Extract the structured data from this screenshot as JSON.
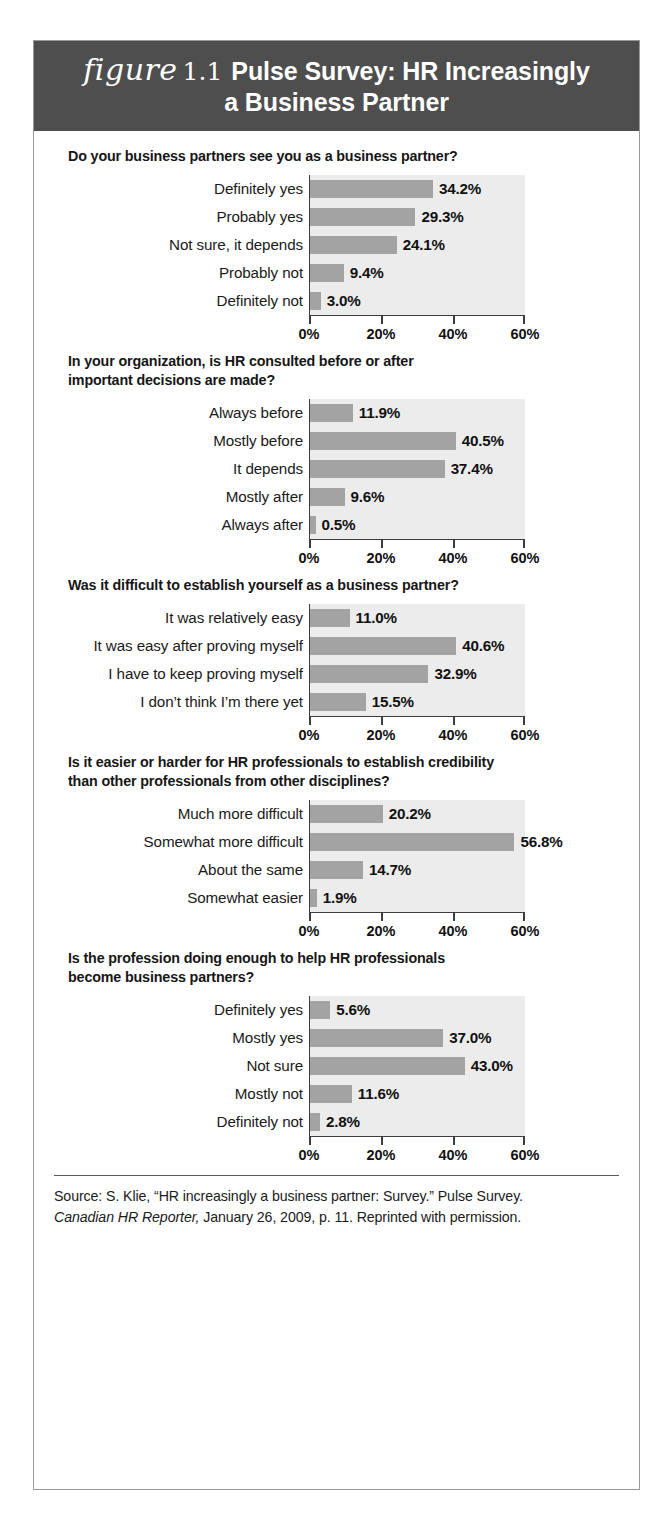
{
  "figure": {
    "label_word": "figure",
    "number": "1.1",
    "title_line1": "Pulse Survey: HR Increasingly",
    "title_line2": "a Business Partner",
    "header_bg": "#4e4e4e",
    "bar_color": "#a3a3a3",
    "plot_bg": "#ececec",
    "axis_color": "#3d3d3d"
  },
  "source": {
    "line1": "Source: S. Klie, “HR increasingly a business partner: Survey.” Pulse Survey.",
    "line2_italic": "Canadian HR Reporter,",
    "line2_rest": " January 26, 2009, p. 11. Reprinted with permission."
  },
  "axis": {
    "ticks": [
      "0%",
      "20%",
      "40%",
      "60%"
    ],
    "min": 0,
    "max": 60
  },
  "chart_data": [
    {
      "type": "bar",
      "orientation": "horizontal",
      "title": "Do your business partners see you as a business partner?",
      "categories": [
        "Definitely yes",
        "Probably yes",
        "Not sure, it depends",
        "Probably not",
        "Definitely not"
      ],
      "values": [
        34.2,
        29.3,
        24.1,
        9.4,
        3.0
      ],
      "labels": [
        "34.2%",
        "29.3%",
        "24.1%",
        "9.4%",
        "3.0%"
      ],
      "xlabel": "",
      "ylabel": "",
      "xlim": [
        0,
        60
      ],
      "xticks": [
        "0%",
        "20%",
        "40%",
        "60%"
      ],
      "grid": false,
      "legend": false
    },
    {
      "type": "bar",
      "orientation": "horizontal",
      "title": "In your organization, is HR consulted before or after important decisions are made?",
      "title_line1": "In your organization, is HR consulted before or after",
      "title_line2": "important decisions are made?",
      "categories": [
        "Always before",
        "Mostly before",
        "It depends",
        "Mostly after",
        "Always after"
      ],
      "values": [
        11.9,
        40.5,
        37.4,
        9.6,
        0.5
      ],
      "labels": [
        "11.9%",
        "40.5%",
        "37.4%",
        "9.6%",
        "0.5%"
      ],
      "xlabel": "",
      "ylabel": "",
      "xlim": [
        0,
        60
      ],
      "xticks": [
        "0%",
        "20%",
        "40%",
        "60%"
      ],
      "grid": false,
      "legend": false
    },
    {
      "type": "bar",
      "orientation": "horizontal",
      "title": "Was it difficult to establish yourself as a business partner?",
      "categories": [
        "It was relatively easy",
        "It was easy after proving myself",
        "I have to keep proving myself",
        "I don’t think I’m there yet"
      ],
      "values": [
        11.0,
        40.6,
        32.9,
        15.5
      ],
      "labels": [
        "11.0%",
        "40.6%",
        "32.9%",
        "15.5%"
      ],
      "xlabel": "",
      "ylabel": "",
      "xlim": [
        0,
        60
      ],
      "xticks": [
        "0%",
        "20%",
        "40%",
        "60%"
      ],
      "grid": false,
      "legend": false
    },
    {
      "type": "bar",
      "orientation": "horizontal",
      "title": "Is it easier or harder for HR professionals to establish credibility than other professionals from other disciplines?",
      "title_line1": "Is it easier or harder for HR professionals to establish credibility",
      "title_line2": "than other professionals from other disciplines?",
      "categories": [
        "Much more difficult",
        "Somewhat more difficult",
        "About the same",
        "Somewhat easier"
      ],
      "values": [
        20.2,
        56.8,
        14.7,
        1.9
      ],
      "labels": [
        "20.2%",
        "56.8%",
        "14.7%",
        "1.9%"
      ],
      "xlabel": "",
      "ylabel": "",
      "xlim": [
        0,
        60
      ],
      "xticks": [
        "0%",
        "20%",
        "40%",
        "60%"
      ],
      "grid": false,
      "legend": false
    },
    {
      "type": "bar",
      "orientation": "horizontal",
      "title": "Is the profession doing enough to help HR professionals become business partners?",
      "title_line1": "Is the profession doing enough to help HR professionals",
      "title_line2": "become business partners?",
      "categories": [
        "Definitely yes",
        "Mostly yes",
        "Not sure",
        "Mostly not",
        "Definitely not"
      ],
      "values": [
        5.6,
        37.0,
        43.0,
        11.6,
        2.8
      ],
      "labels": [
        "5.6%",
        "37.0%",
        "43.0%",
        "11.6%",
        "2.8%"
      ],
      "xlabel": "",
      "ylabel": "",
      "xlim": [
        0,
        60
      ],
      "xticks": [
        "0%",
        "20%",
        "40%",
        "60%"
      ],
      "grid": false,
      "legend": false
    }
  ]
}
